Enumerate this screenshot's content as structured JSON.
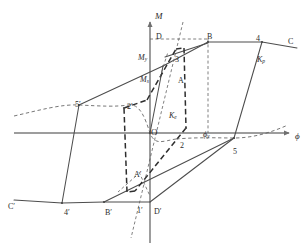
{
  "figure": {
    "type": "diagram",
    "axes": {
      "vertical_label": "M",
      "horizontal_label": "ϕ",
      "origin_label": "O"
    },
    "colors": {
      "curve": "#4a4a4a",
      "axis": "#7d7d7d",
      "dashed": "#5a5a5a",
      "heavy_dashed": "#2e2e2e",
      "text": "#2b2b2b",
      "background": "#ffffff"
    },
    "labels": [
      {
        "id": "axis-m",
        "text": "M",
        "sub": "",
        "x": 155,
        "y": 12,
        "italic": true,
        "size": "big"
      },
      {
        "id": "axis-phi",
        "text": "ϕ",
        "sub": "",
        "x": 295,
        "y": 132,
        "italic": true,
        "size": "big"
      },
      {
        "id": "origin-o",
        "text": "O",
        "sub": "",
        "x": 151,
        "y": 128,
        "italic": false,
        "size": "big"
      },
      {
        "id": "point-d",
        "text": "D",
        "sub": "",
        "x": 156,
        "y": 33,
        "italic": false,
        "size": ""
      },
      {
        "id": "point-b",
        "text": "B",
        "sub": "",
        "x": 207,
        "y": 33,
        "italic": false,
        "size": ""
      },
      {
        "id": "point-4",
        "text": "4",
        "sub": "",
        "x": 256,
        "y": 35,
        "italic": false,
        "size": ""
      },
      {
        "id": "point-c",
        "text": "C",
        "sub": "",
        "x": 288,
        "y": 38,
        "italic": false,
        "size": ""
      },
      {
        "id": "point-3",
        "text": "3",
        "sub": "",
        "x": 175,
        "y": 56,
        "italic": false,
        "size": ""
      },
      {
        "id": "point-a",
        "text": "A",
        "sub": "",
        "x": 178,
        "y": 77,
        "italic": false,
        "size": ""
      },
      {
        "id": "moment-my",
        "text": "M",
        "sub": "y",
        "x": 138,
        "y": 54,
        "italic": true,
        "size": ""
      },
      {
        "id": "moment-ms",
        "text": "M",
        "sub": "s",
        "x": 140,
        "y": 76,
        "italic": true,
        "size": ""
      },
      {
        "id": "stiff-ke",
        "text": "K",
        "sub": "e",
        "x": 169,
        "y": 112,
        "italic": true,
        "size": ""
      },
      {
        "id": "stiff-kp",
        "text": "K",
        "sub": "p",
        "x": 257,
        "y": 56,
        "italic": true,
        "size": ""
      },
      {
        "id": "rot-phiy",
        "text": "ϕ",
        "sub": "y",
        "x": 203,
        "y": 131,
        "italic": true,
        "size": ""
      },
      {
        "id": "point-5prime",
        "text": "5′",
        "sub": "",
        "x": 75,
        "y": 101,
        "italic": false,
        "size": ""
      },
      {
        "id": "point-2prime",
        "text": "2′",
        "sub": "",
        "x": 127,
        "y": 103,
        "italic": false,
        "size": ""
      },
      {
        "id": "point-2",
        "text": "2",
        "sub": "",
        "x": 180,
        "y": 142,
        "italic": false,
        "size": ""
      },
      {
        "id": "point-5",
        "text": "5",
        "sub": "",
        "x": 233,
        "y": 148,
        "italic": false,
        "size": ""
      },
      {
        "id": "point-aprime",
        "text": "A′",
        "sub": "",
        "x": 134,
        "y": 171,
        "italic": false,
        "size": ""
      },
      {
        "id": "point-cprime",
        "text": "C′",
        "sub": "",
        "x": 8,
        "y": 203,
        "italic": false,
        "size": ""
      },
      {
        "id": "point-4prime",
        "text": "4′",
        "sub": "",
        "x": 64,
        "y": 209,
        "italic": false,
        "size": ""
      },
      {
        "id": "point-bprime",
        "text": "B′",
        "sub": "",
        "x": 105,
        "y": 209,
        "italic": false,
        "size": ""
      },
      {
        "id": "point-1prime",
        "text": "1′",
        "sub": "",
        "x": 137,
        "y": 207,
        "italic": false,
        "size": ""
      },
      {
        "id": "point-dprime",
        "text": "D′",
        "sub": "",
        "x": 154,
        "y": 208,
        "italic": false,
        "size": ""
      }
    ]
  },
  "chart_data": {
    "type": "line",
    "xlabel": "ϕ",
    "ylabel": "M",
    "annotations": [
      "M_y",
      "M_s",
      "K_e",
      "K_p",
      "ϕ_y",
      "O",
      "A",
      "B",
      "C",
      "D",
      "3",
      "4",
      "2",
      "5",
      "A′",
      "B′",
      "C′",
      "D′",
      "1′",
      "2′",
      "4′",
      "5′"
    ],
    "series": [
      {
        "name": "upper-backbone",
        "points": [
          [
            150,
            133
          ],
          [
            163,
            66
          ],
          [
            207,
            42
          ],
          [
            262,
            42
          ],
          [
            298,
            47
          ]
        ]
      },
      {
        "name": "lower-backbone",
        "points": [
          [
            150,
            133
          ],
          [
            136,
            199
          ],
          [
            95,
            202
          ],
          [
            48,
            201
          ],
          [
            14,
            198
          ]
        ]
      },
      {
        "name": "unload-right",
        "points": [
          [
            262,
            42
          ],
          [
            237,
            131
          ],
          [
            228,
            141
          ]
        ]
      },
      {
        "name": "unload-left",
        "points": [
          [
            48,
            201
          ],
          [
            72,
            113
          ],
          [
            80,
            103
          ]
        ]
      }
    ]
  }
}
